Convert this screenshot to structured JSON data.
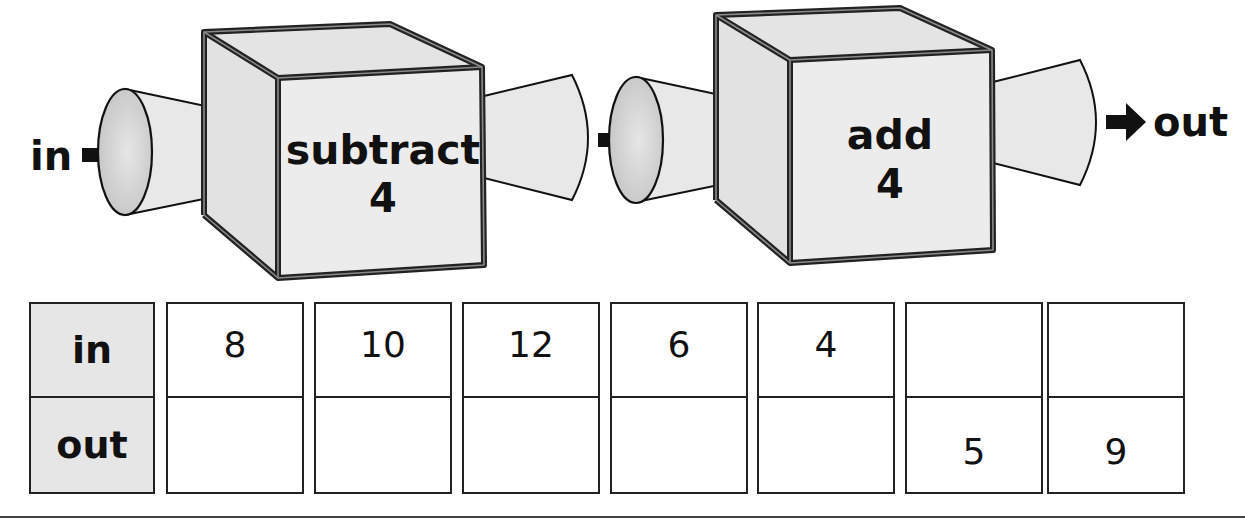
{
  "diagram": {
    "type": "function-machine",
    "input_label": "in",
    "output_label": "out",
    "machines": [
      {
        "operation": "subtract",
        "operand": "4"
      },
      {
        "operation": "add",
        "operand": "4"
      }
    ]
  },
  "table": {
    "row_headers": [
      "in",
      "out"
    ],
    "columns": [
      {
        "in": "8",
        "out": ""
      },
      {
        "in": "10",
        "out": ""
      },
      {
        "in": "12",
        "out": ""
      },
      {
        "in": "6",
        "out": ""
      },
      {
        "in": "4",
        "out": ""
      },
      {
        "in": "",
        "out": "5"
      },
      {
        "in": "",
        "out": "9"
      }
    ]
  },
  "colors": {
    "outline": "#222222",
    "face": "#e8e8e8",
    "header_fill": "#e6e6e6",
    "funnel_inner": "#cfcfcf"
  }
}
